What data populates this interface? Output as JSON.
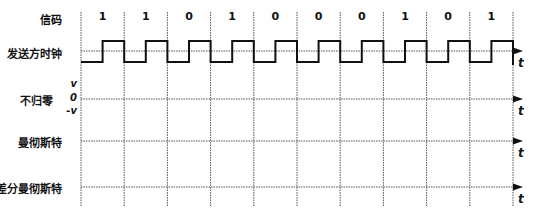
{
  "rows": {
    "code": "信码",
    "clock": "发送方时钟",
    "nrz": "不归零",
    "manchester": "曼彻斯特",
    "diff_manchester": "差分曼彻斯特"
  },
  "bits": [
    "1",
    "1",
    "0",
    "1",
    "0",
    "0",
    "0",
    "1",
    "0",
    "1"
  ],
  "nrz_levels": {
    "high": "v",
    "zero": "0",
    "low": "-v"
  },
  "time_axis_label": "t",
  "colors": {
    "line": "#111111",
    "grid": "#555555"
  }
}
